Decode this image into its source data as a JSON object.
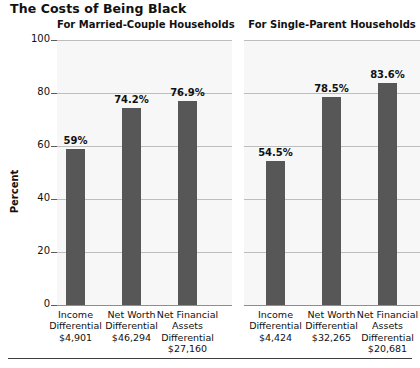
{
  "title": "The Costs of Being Black",
  "axis": {
    "ylabel": "Percent",
    "yticks": [
      "100",
      "80",
      "60",
      "40",
      "20",
      "0"
    ]
  },
  "panels": [
    {
      "key": "married",
      "subtitle": "For Married-Couple Households",
      "bars": [
        {
          "value_label": "59%",
          "cat_line1": "Income",
          "cat_line2": "Differential",
          "cat_line3": "$4,901",
          "cat_line4": ""
        },
        {
          "value_label": "74.2%",
          "cat_line1": "Net Worth",
          "cat_line2": "Differential",
          "cat_line3": "$46,294",
          "cat_line4": ""
        },
        {
          "value_label": "76.9%",
          "cat_line1": "Net Financial",
          "cat_line2": "Assets",
          "cat_line3": "Differential",
          "cat_line4": "$27,160"
        }
      ]
    },
    {
      "key": "single",
      "subtitle": "For Single-Parent Households",
      "bars": [
        {
          "value_label": "54.5%",
          "cat_line1": "Income",
          "cat_line2": "Differential",
          "cat_line3": "$4,424",
          "cat_line4": ""
        },
        {
          "value_label": "78.5%",
          "cat_line1": "Net Worth",
          "cat_line2": "Differential",
          "cat_line3": "$32,265",
          "cat_line4": ""
        },
        {
          "value_label": "83.6%",
          "cat_line1": "Net Financial",
          "cat_line2": "Assets",
          "cat_line3": "Differential",
          "cat_line4": "$20,681"
        }
      ]
    }
  ],
  "colors": {
    "bar": "#575757",
    "panel_background": "#f7f7f7",
    "gridline": "#bdbdbd",
    "text": "#111111"
  },
  "chart_data": {
    "type": "bar",
    "title": "The Costs of Being Black",
    "xlabel": "",
    "ylabel": "Percent",
    "ylim": [
      0,
      100
    ],
    "yticks": [
      0,
      20,
      40,
      60,
      80,
      100
    ],
    "grid": true,
    "legend": "none",
    "panels": [
      {
        "subtitle": "For Married-Couple Households",
        "categories": [
          "Income Differential $4,901",
          "Net Worth Differential $46,294",
          "Net Financial Assets Differential $27,160"
        ],
        "values": [
          59,
          74.2,
          76.9
        ],
        "data_labels": [
          "59%",
          "74.2%",
          "76.9%"
        ],
        "dollar_amounts": [
          "$4,901",
          "$46,294",
          "$27,160"
        ]
      },
      {
        "subtitle": "For Single-Parent Households",
        "categories": [
          "Income Differential $4,424",
          "Net Worth Differential $32,265",
          "Net Financial Assets Differential $20,681"
        ],
        "values": [
          54.5,
          78.5,
          83.6
        ],
        "data_labels": [
          "54.5%",
          "78.5%",
          "83.6%"
        ],
        "dollar_amounts": [
          "$4,424",
          "$32,265",
          "$20,681"
        ]
      }
    ]
  }
}
